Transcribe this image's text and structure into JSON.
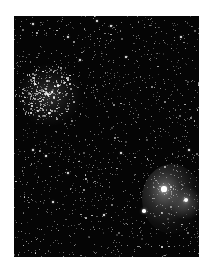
{
  "image": {
    "subject": "star field with open star cluster (upper left) and emission nebula (lower right)",
    "frame": {
      "x": 14,
      "y": 16,
      "width": 185,
      "height": 241
    },
    "background_color": "#050505",
    "page_background": "#ffffff"
  },
  "starfield": {
    "seed": 1337,
    "background_star_count": 1400,
    "cluster": {
      "cx": 32,
      "cy": 76,
      "radius": 30,
      "extra_stars": 260
    },
    "nebula": {
      "cx": 150,
      "cy": 173,
      "radius": 26,
      "extra_stars": 60
    }
  },
  "bright_stars": [
    {
      "x": 150,
      "y": 173,
      "r": 2.6
    },
    {
      "x": 172,
      "y": 184,
      "r": 2.2
    },
    {
      "x": 130,
      "y": 195,
      "r": 1.8
    },
    {
      "x": 19,
      "y": 8,
      "r": 1.3
    },
    {
      "x": 54,
      "y": 21,
      "r": 1.2
    },
    {
      "x": 66,
      "y": 44,
      "r": 1.2
    },
    {
      "x": 83,
      "y": 5,
      "r": 1.1
    },
    {
      "x": 97,
      "y": 10,
      "r": 1.2
    },
    {
      "x": 112,
      "y": 41,
      "r": 1.2
    },
    {
      "x": 167,
      "y": 21,
      "r": 1.1
    },
    {
      "x": 19,
      "y": 134,
      "r": 1.3
    },
    {
      "x": 32,
      "y": 140,
      "r": 1.2
    },
    {
      "x": 54,
      "y": 157,
      "r": 1.4
    },
    {
      "x": 39,
      "y": 186,
      "r": 1.3
    },
    {
      "x": 107,
      "y": 137,
      "r": 1.2
    },
    {
      "x": 175,
      "y": 134,
      "r": 1.2
    },
    {
      "x": 38,
      "y": 76,
      "r": 1.3
    },
    {
      "x": 44,
      "y": 70,
      "r": 1.1
    },
    {
      "x": 90,
      "y": 199,
      "r": 1.1
    },
    {
      "x": 148,
      "y": 231,
      "r": 1.0
    }
  ]
}
